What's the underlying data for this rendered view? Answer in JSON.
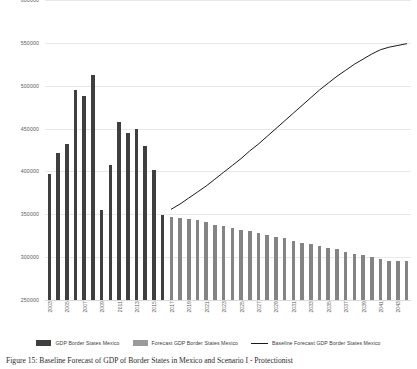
{
  "chart_data": {
    "type": "bar",
    "title": "",
    "xlabel": "",
    "ylabel": "",
    "ylim": [
      250000,
      600000
    ],
    "yticks": [
      600000,
      550000,
      500000,
      450000,
      400000,
      350000,
      300000,
      250000
    ],
    "ytick_labels": [
      "600000",
      "550000",
      "500000",
      "450000",
      "400000",
      "350000",
      "300000",
      "250000"
    ],
    "grid": true,
    "legend_position": "bottom",
    "categories": [
      "2003",
      "2004",
      "2005",
      "2006",
      "2007",
      "2008",
      "2009",
      "2010",
      "2011",
      "2012",
      "2013",
      "2014",
      "2015",
      "2016",
      "2017",
      "2018",
      "2019",
      "2020",
      "2021",
      "2022",
      "2023",
      "2024",
      "2025",
      "2026",
      "2027",
      "2028",
      "2029",
      "2030",
      "2031",
      "2032",
      "2033",
      "2034",
      "2035",
      "2036",
      "2037",
      "2038",
      "2039",
      "2040",
      "2041",
      "2042",
      "2043",
      "2044"
    ],
    "xtick_labels": [
      "2003",
      "",
      "2005",
      "",
      "2007",
      "",
      "2009",
      "",
      "2011",
      "",
      "2013",
      "",
      "2015",
      "",
      "2017",
      "",
      "2019",
      "",
      "2021",
      "",
      "2023",
      "",
      "2025",
      "",
      "2027",
      "",
      "2029",
      "",
      "2031",
      "",
      "2033",
      "",
      "2035",
      "",
      "2037",
      "",
      "2039",
      "",
      "2041",
      "",
      "2043",
      ""
    ],
    "series": [
      {
        "name": "GDP Border States Mexico",
        "type": "bar",
        "color": "#3f3f3f",
        "values": [
          397000,
          421000,
          432000,
          495000,
          488000,
          512000,
          355000,
          408000,
          458000,
          445000,
          450000,
          430000,
          402000,
          349000,
          null,
          null,
          null,
          null,
          null,
          null,
          null,
          null,
          null,
          null,
          null,
          null,
          null,
          null,
          null,
          null,
          null,
          null,
          null,
          null,
          null,
          null,
          null,
          null,
          null,
          null,
          null,
          null
        ]
      },
      {
        "name": "Forecast GDP Border States Mexico",
        "type": "bar",
        "color": "#848484",
        "values": [
          null,
          null,
          null,
          null,
          null,
          null,
          null,
          null,
          null,
          null,
          null,
          null,
          null,
          null,
          347000,
          346000,
          345000,
          343000,
          341000,
          338000,
          336000,
          334000,
          332000,
          330000,
          328000,
          326000,
          324000,
          322000,
          319000,
          317000,
          315000,
          313000,
          311000,
          309000,
          306000,
          304000,
          302000,
          300000,
          298000,
          296000,
          295000,
          295000
        ]
      },
      {
        "name": "Baseline Forecast GDP Border States Mexico",
        "type": "line",
        "color": "#1a1a1a",
        "values": [
          null,
          null,
          null,
          null,
          null,
          null,
          null,
          null,
          null,
          null,
          null,
          null,
          null,
          null,
          356000,
          362000,
          369000,
          376000,
          383000,
          391000,
          399000,
          407000,
          415000,
          424000,
          432000,
          441000,
          450000,
          459000,
          468000,
          477000,
          486000,
          495000,
          503000,
          511000,
          518000,
          525000,
          531000,
          537000,
          542000,
          545000,
          547000,
          549000
        ]
      }
    ],
    "legend": [
      {
        "label": "GDP Border States Mexico",
        "marker": "bar",
        "color": "#3f3f3f"
      },
      {
        "label": "Forecast GDP Border States Mexico",
        "marker": "bar",
        "color": "#9a9a9a"
      },
      {
        "label": "Baseline Forecast GDP Border States Mexico",
        "marker": "line",
        "color": "#1a1a1a"
      }
    ]
  },
  "caption": {
    "text": "Figure 15: Baseline Forecast of GDP of Border States in Mexico and Scenario I - Protectionist"
  }
}
